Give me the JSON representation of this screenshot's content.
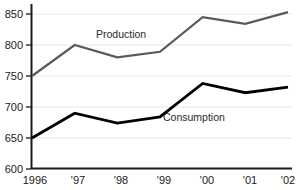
{
  "chart_data": {
    "type": "line",
    "title": "",
    "xlabel": "",
    "ylabel": "",
    "categories": [
      "1996",
      "'97",
      "'98",
      "'99",
      "'00",
      "'01",
      "'02"
    ],
    "x_tick_labels": [
      "1996",
      "'97",
      "'98",
      "'99",
      "'00",
      "'01",
      "'02"
    ],
    "y_tick_labels": [
      "600",
      "650",
      "700",
      "750",
      "800",
      "850"
    ],
    "y_ticks": [
      600,
      650,
      700,
      750,
      800,
      850
    ],
    "ylim": [
      600,
      865
    ],
    "grid": "horizontal",
    "legend_position": "inline-labels",
    "series": [
      {
        "name": "Production",
        "label": "Production",
        "color": "#5a5a5a",
        "values": [
          750,
          800,
          780,
          789,
          845,
          834,
          853
        ]
      },
      {
        "name": "Consumption",
        "label": "Consumption",
        "color": "#000000",
        "values": [
          650,
          690,
          674,
          684,
          738,
          723,
          732
        ]
      }
    ],
    "colors": {
      "production_line": "#5a5a5a",
      "consumption_line": "#000000",
      "axis": "#1a1a1a",
      "gridline": "#e2e2e2",
      "background": "#ffffff",
      "text": "#1a1a1a"
    }
  }
}
